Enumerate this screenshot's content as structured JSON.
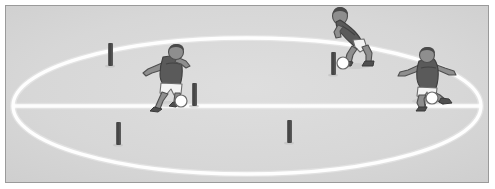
{
  "figure": {
    "title": "Soccer training drill diagram",
    "caption": "",
    "type": "illustration",
    "width": 495,
    "height": 189
  },
  "palette": {
    "page_background": "#ffffff",
    "frame_border": "#9a9a9a",
    "field_fill": "#d6d6d6",
    "field_fill_inner": "#dcdcdc",
    "field_line": "#ffffff",
    "marker_pole": "#565656",
    "marker_pole_shadow": "#3d3d3d",
    "player_jersey": "#5a5a5a",
    "player_jersey_shade": "#444444",
    "player_shorts": "#f2f2f2",
    "player_skin": "#8e8e8e",
    "player_hair": "#4a4a4a",
    "player_boot": "#4f4f4f",
    "ball_fill": "#ffffff",
    "ball_stroke": "#6b6b6b"
  },
  "field": {
    "name": "training-pitch",
    "surface_label": "grass",
    "border": {
      "x": 5,
      "y": 5,
      "width": 484,
      "height": 178
    },
    "center_ellipse": {
      "cx": 247,
      "cy": 106,
      "rx": 234,
      "ry": 68,
      "stroke_width": 3
    },
    "halfway_line": {
      "x1": 13,
      "y1": 106,
      "x2": 481,
      "y2": 106,
      "stroke_width": 3
    }
  },
  "markers": [
    {
      "id": "pole-1",
      "label": "marker pole",
      "x": 108,
      "y": 43,
      "width": 5,
      "height": 22
    },
    {
      "id": "pole-2",
      "label": "marker pole",
      "x": 192,
      "y": 83,
      "width": 5,
      "height": 22
    },
    {
      "id": "pole-3",
      "label": "marker pole",
      "x": 116,
      "y": 122,
      "width": 5,
      "height": 22
    },
    {
      "id": "pole-4",
      "label": "marker pole",
      "x": 287,
      "y": 120,
      "width": 5,
      "height": 22
    },
    {
      "id": "pole-5",
      "label": "marker pole",
      "x": 331,
      "y": 52,
      "width": 5,
      "height": 22
    },
    {
      "id": "pole-6",
      "label": "marker pole",
      "x": 421,
      "y": 84,
      "width": 5,
      "height": 22
    }
  ],
  "players": [
    {
      "id": "player-left",
      "label": "Player dribbling left-centre",
      "action": "dribbling",
      "x": 150,
      "y": 45,
      "has_ball": true,
      "ball": {
        "cx": 181,
        "cy": 101,
        "r": 6
      }
    },
    {
      "id": "player-top",
      "label": "Player bending forward top-centre",
      "action": "turning over ball",
      "x": 325,
      "y": 4,
      "has_ball": true,
      "ball": {
        "cx": 343,
        "cy": 63,
        "r": 6
      }
    },
    {
      "id": "player-right",
      "label": "Player with arms outstretched right",
      "action": "shielding ball",
      "x": 398,
      "y": 44,
      "has_ball": true,
      "ball": {
        "cx": 432,
        "cy": 98,
        "r": 6
      }
    }
  ],
  "balls": [
    {
      "id": "ball-1",
      "label": "soccer ball",
      "cx": 181,
      "cy": 101,
      "r": 6
    },
    {
      "id": "ball-2",
      "label": "soccer ball",
      "cx": 343,
      "cy": 63,
      "r": 6
    },
    {
      "id": "ball-3",
      "label": "soccer ball",
      "cx": 432,
      "cy": 98,
      "r": 6
    }
  ]
}
